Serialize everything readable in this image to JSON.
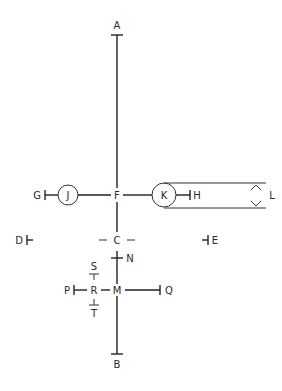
{
  "diagram": {
    "stroke_color": "#222222",
    "background": "#ffffff",
    "labels": {
      "A": "A",
      "B": "B",
      "C": "C",
      "D": "D",
      "E": "E",
      "F": "F",
      "G": "G",
      "H": "H",
      "J": "J",
      "K": "K",
      "L": "L",
      "M": "M",
      "N": "N",
      "P": "P",
      "Q": "Q",
      "R": "R",
      "S": "S",
      "T": "T"
    }
  }
}
